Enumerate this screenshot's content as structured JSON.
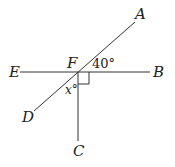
{
  "diagram": {
    "type": "geometry",
    "points": {
      "A": {
        "label": "A"
      },
      "B": {
        "label": "B"
      },
      "C": {
        "label": "C"
      },
      "D": {
        "label": "D"
      },
      "E": {
        "label": "E"
      },
      "F": {
        "label": "F"
      }
    },
    "lines": [
      {
        "name": "line-EB",
        "from": "E",
        "to": "B"
      },
      {
        "name": "line-DA",
        "from": "D",
        "to": "A"
      },
      {
        "name": "ray-FC",
        "from": "F",
        "to": "C"
      }
    ],
    "angles": {
      "AFB": {
        "label": "40°"
      },
      "DFC": {
        "label": "x°"
      },
      "BFC": {
        "right_angle": true
      }
    },
    "colors": {
      "stroke": "#333333",
      "background": "#ffffff"
    }
  }
}
